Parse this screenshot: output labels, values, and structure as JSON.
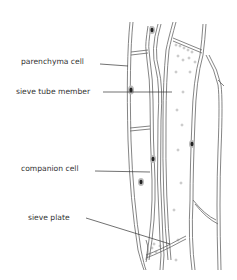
{
  "diagram": {
    "labels": [
      {
        "id": "parenchyma",
        "text": "parenchyma cell",
        "x": 21,
        "y": 58
      },
      {
        "id": "sieve-tube",
        "text": "sieve tube member",
        "x": 16,
        "y": 88
      },
      {
        "id": "companion",
        "text": "companion cell",
        "x": 21,
        "y": 165
      },
      {
        "id": "sieve-plate",
        "text": "sieve plate",
        "x": 28,
        "y": 214
      }
    ],
    "colors": {
      "line": "#555555",
      "nucleus": "#222222",
      "nucleus_halo": "#999999",
      "background": "#ffffff"
    }
  }
}
